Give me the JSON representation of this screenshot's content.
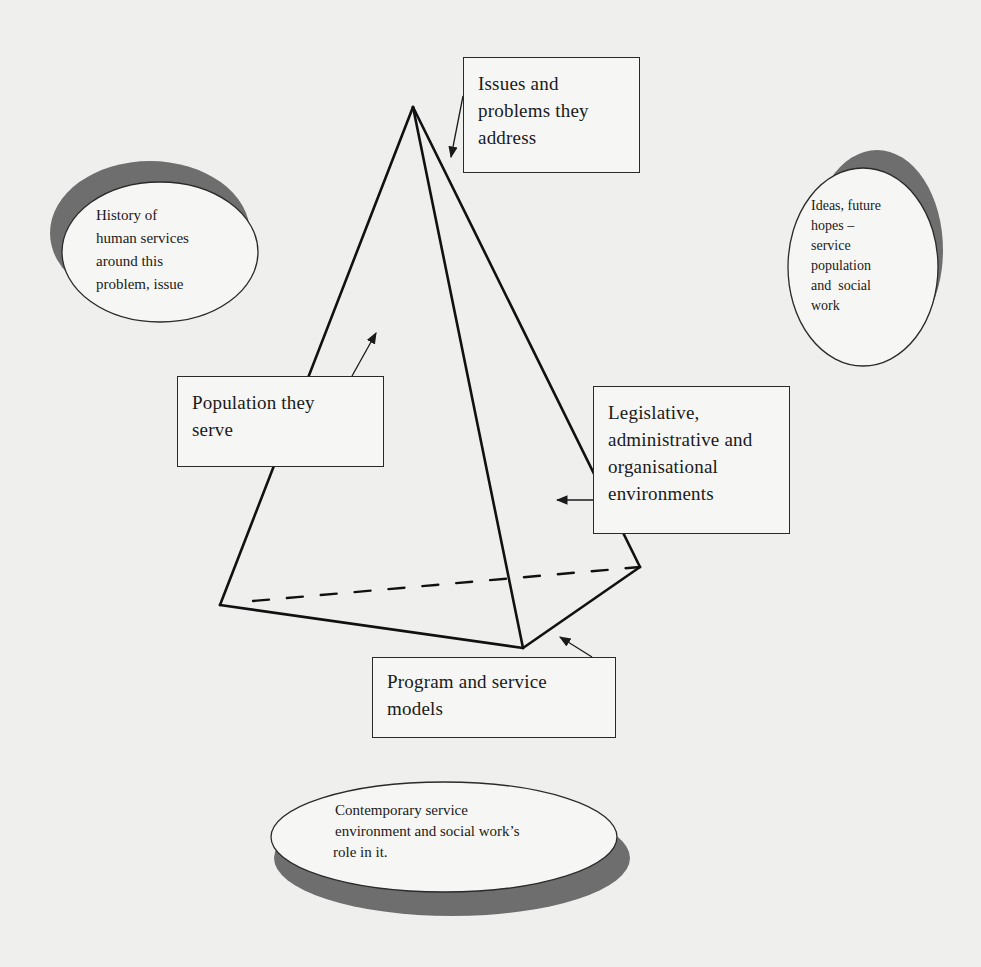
{
  "diagram": {
    "type": "pyramid-concept-map",
    "pyramid": {
      "apex": [
        413,
        107
      ],
      "base_left": [
        220,
        605
      ],
      "base_front": [
        523,
        648
      ],
      "base_right": [
        640,
        567
      ],
      "hidden_edge": "dashed from base_left to base_right"
    },
    "boxes": {
      "issues": {
        "lines": [
          "Issues and",
          "problems they",
          "address"
        ]
      },
      "population": {
        "lines": [
          "Population they",
          "serve"
        ]
      },
      "legislative": {
        "lines": [
          "Legislative,",
          "administrative and",
          "organisational",
          "environments"
        ]
      },
      "program": {
        "lines": [
          "Program and service",
          "models"
        ]
      }
    },
    "ellipses": {
      "history": {
        "lines": [
          "History of",
          "human services",
          "around this",
          "problem, issue"
        ]
      },
      "ideas": {
        "lines": [
          "Ideas, future",
          "hopes –",
          "service",
          "population",
          "and  social",
          "work"
        ]
      },
      "contemporary": {
        "lines": [
          "Contemporary service",
          "environment and social work’s",
          "role in it."
        ]
      }
    },
    "colors": {
      "background": "#efefed",
      "stroke": "#1a1a1a",
      "shadow": "#6e6e6e",
      "fill": "#f6f6f4"
    }
  }
}
